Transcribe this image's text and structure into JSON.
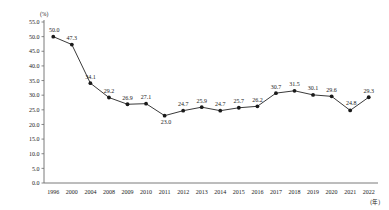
{
  "chart_data": {
    "type": "line",
    "title": "",
    "xlabel": "(年)",
    "ylabel": "(%)",
    "ylim": [
      0.0,
      55.0
    ],
    "ytick_step": 5.0,
    "grid": false,
    "legend": "none",
    "categories": [
      "1996",
      "2000",
      "2004",
      "2008",
      "2009",
      "2010",
      "2011",
      "2012",
      "2013",
      "2014",
      "2015",
      "2016",
      "2017",
      "2018",
      "2019",
      "2020",
      "2021",
      "2022"
    ],
    "values": [
      50.0,
      47.3,
      34.1,
      29.2,
      26.9,
      27.1,
      23.0,
      24.7,
      25.9,
      24.7,
      25.7,
      26.2,
      30.7,
      31.5,
      30.1,
      29.6,
      24.8,
      29.3
    ],
    "point_labels": [
      "50.0",
      "47.3",
      "34.1",
      "29.2",
      "26.9",
      "27.1",
      "23.0",
      "24.7",
      "25.9",
      "24.7",
      "25.7",
      "26.2",
      "30.7",
      "31.5",
      "30.1",
      "29.6",
      "24.8",
      "29.3"
    ],
    "ytick_labels": [
      "0.0",
      "5.0",
      "10.0",
      "15.0",
      "20.0",
      "25.0",
      "30.0",
      "35.0",
      "40.0",
      "45.0",
      "50.0",
      "55.0"
    ],
    "ytick_values": [
      0.0,
      5.0,
      10.0,
      15.0,
      20.0,
      25.0,
      30.0,
      35.0,
      40.0,
      45.0,
      50.0,
      55.0
    ],
    "series_color": "#3a3a3a",
    "axis_color": "#6b6b6b",
    "background_color": "#ffffff"
  }
}
